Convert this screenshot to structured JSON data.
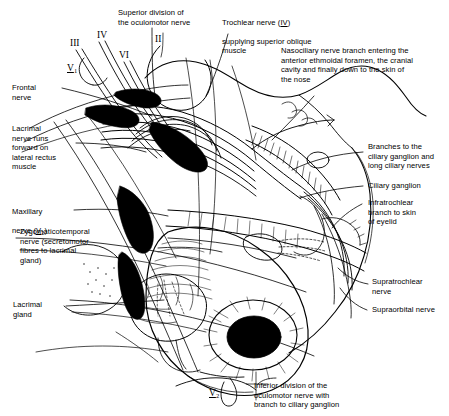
{
  "figure": {
    "type": "anatomical-line-diagram",
    "style": "black-and-white pen-and-ink line drawing",
    "background_color": "#ffffff",
    "ink_color": "#000000"
  },
  "cranial_nerve_markers": [
    {
      "id": "marker-III",
      "text": "III",
      "underline": false,
      "x": 70,
      "y": 38
    },
    {
      "id": "marker-IV",
      "text": "IV",
      "underline": false,
      "x": 97,
      "y": 30
    },
    {
      "id": "marker-V1",
      "text": "V",
      "sub": "1",
      "underline": true,
      "x": 67,
      "y": 63
    },
    {
      "id": "marker-VI",
      "text": "VI",
      "underline": false,
      "x": 119,
      "y": 50
    },
    {
      "id": "marker-II",
      "text": "II",
      "underline": false,
      "x": 155,
      "y": 34
    },
    {
      "id": "marker-V2-bottom",
      "text": "V",
      "sub": "2",
      "underline": true,
      "x": 209,
      "y": 388
    }
  ],
  "labels": {
    "superior_division": "Superior division of\nthe oculomotor nerve",
    "trochlear": {
      "line1_a": "Trochlear nerve (",
      "line1_numeral": "IV",
      "line1_b": ")",
      "rest": "supplying superior oblique\nmuscle"
    },
    "nasociliary": "Nasociliary nerve branch entering the\nanterior ethmoidal foramen, the cranial\ncavity and finally down to the skin of\nthe nose",
    "frontal": "Frontal\nnerve",
    "lacrimal_nerve": "Lacrimal\nnerve runs\nforward on\nlateral rectus\nmuscle",
    "maxillary": {
      "line1": "Maxillary",
      "line2_a": "nerve (",
      "line2_numeral": "V",
      "line2_sub": "2",
      "line2_b": ")"
    },
    "zygomaticotemporal": "Zygomaticotemporal\nnerve (secretomotor\nfibres to lacrimal\ngland)",
    "lacrimal_gland": "Lacrimal\ngland",
    "branches_ciliary": "Branches to the\nciliary ganglion and\nlong ciliary nerves",
    "ciliary_ganglion": "Ciliary ganglion",
    "infratrochlear": "Infratrochlear\nbranch to skin\nof eyelid",
    "supratrochlear": "Supratrochlear\nnerve",
    "supraorbital": "Supraorbital nerve",
    "inferior_division": "Inferior division of the\noculomotor nerve with\nbranch to ciliary ganglion"
  }
}
